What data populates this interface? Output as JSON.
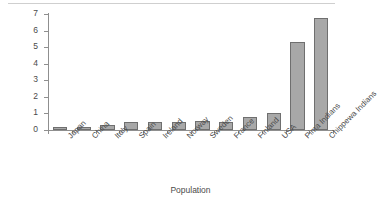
{
  "chart_data": {
    "type": "bar",
    "title": "",
    "xlabel": "Population",
    "ylabel": "Prevalence (%)",
    "ylim": [
      0,
      7
    ],
    "yticks": [
      0,
      1,
      2,
      3,
      4,
      5,
      6,
      7
    ],
    "ytick_labels": [
      "0",
      "1",
      "2",
      "3",
      "4",
      "5",
      "6",
      "7"
    ],
    "grid": false,
    "legend": false,
    "bar_color": "#a8a8a8",
    "bar_edge_color": "#6f6f6f",
    "axis_color": "#8f8f8f",
    "categories": [
      "Japan",
      "China",
      "Italy",
      "Spain",
      "Ireland",
      "Norway",
      "Sweden",
      "France",
      "Finland",
      "USA",
      "Pima Indians",
      "Chippewa Indians"
    ],
    "values": [
      0.2,
      0.2,
      0.3,
      0.5,
      0.48,
      0.47,
      0.52,
      0.5,
      0.8,
      1.0,
      5.3,
      6.75
    ]
  }
}
